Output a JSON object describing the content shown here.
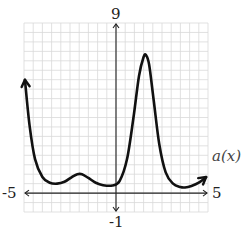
{
  "chart_data": {
    "type": "line",
    "title": "",
    "function_label": "a(x)",
    "xlabel": "",
    "ylabel": "",
    "xlim": [
      -5,
      5
    ],
    "ylim": [
      -1,
      9
    ],
    "x_tick_labels": {
      "min": "-5",
      "max": "5"
    },
    "y_tick_labels": {
      "min": "-1",
      "max": "9"
    },
    "grid": true,
    "grid_step": 0.5,
    "legend": null,
    "series": [
      {
        "name": "a(x)",
        "arrow_start": true,
        "arrow_end": true,
        "x": [
          -4.95,
          -4.7,
          -4.4,
          -4.0,
          -3.6,
          -3.2,
          -2.8,
          -2.4,
          -2.1,
          -1.85,
          -1.5,
          -1.1,
          -0.7,
          -0.2,
          0.2,
          0.6,
          0.95,
          1.25,
          1.5,
          1.63,
          1.8,
          2.05,
          2.35,
          2.7,
          3.1,
          3.5,
          3.75,
          4.1,
          4.5,
          4.9
        ],
        "y": [
          6.0,
          3.6,
          1.8,
          0.85,
          0.55,
          0.5,
          0.6,
          0.85,
          1.0,
          1.0,
          0.8,
          0.55,
          0.42,
          0.4,
          0.65,
          1.8,
          4.0,
          6.2,
          7.2,
          7.3,
          6.8,
          4.9,
          2.6,
          1.1,
          0.5,
          0.32,
          0.3,
          0.38,
          0.55,
          0.85
        ]
      }
    ],
    "key_points": {
      "left_start": [
        -4.95,
        6.0
      ],
      "local_min_1": [
        -3.2,
        0.5
      ],
      "local_max_1": [
        -1.85,
        1.0
      ],
      "local_min_2": [
        -0.2,
        0.4
      ],
      "global_max": [
        1.63,
        7.3
      ],
      "local_min_3": [
        3.75,
        0.3
      ],
      "right_end": [
        4.9,
        0.85
      ]
    }
  },
  "colors": {
    "grid": "#d9d9d9",
    "axis": "#222222",
    "curve": "#111111"
  }
}
